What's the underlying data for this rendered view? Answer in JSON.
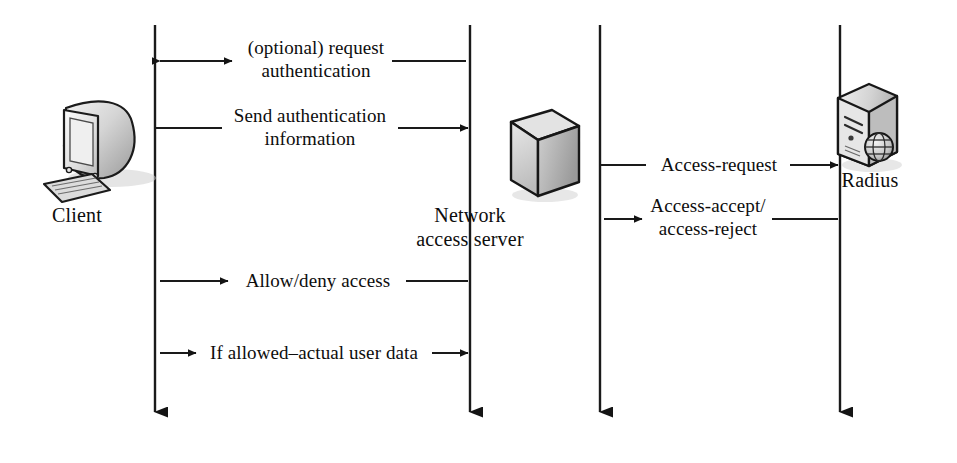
{
  "figure": {
    "type": "sequence-diagram",
    "background_color": "#ffffff",
    "line_color": "#1a1a1a",
    "text_color": "#0d0d0d"
  },
  "actors": [
    {
      "id": "client",
      "label": "Client",
      "icon": "desktop-computer-icon",
      "lifeline_x": 155
    },
    {
      "id": "nas",
      "label": "Network\naccess server",
      "icon": "network-box-icon",
      "lifeline_x": 470
    },
    {
      "id": "nas-right",
      "label": "",
      "icon": "",
      "lifeline_x": 600
    },
    {
      "id": "radius",
      "label": "Radius",
      "icon": "rack-server-globe-icon",
      "lifeline_x": 840
    }
  ],
  "messages": [
    {
      "id": "msg-request-authentication",
      "label": "(optional) request\nauthentication",
      "from": "nas",
      "to": "client",
      "direction": "left",
      "y": 61
    },
    {
      "id": "msg-send-authentication-information",
      "label": "Send authentication\ninformation",
      "from": "client",
      "to": "nas",
      "direction": "right",
      "y": 128
    },
    {
      "id": "msg-access-request",
      "label": "Access-request",
      "from": "nas-right",
      "to": "radius",
      "direction": "right",
      "y": 165
    },
    {
      "id": "msg-access-accept-reject",
      "label": "Access-accept/\naccess-reject",
      "from": "radius",
      "to": "nas-right",
      "direction": "left",
      "y": 219
    },
    {
      "id": "msg-allow-deny-access",
      "label": "Allow/deny access",
      "from": "nas",
      "to": "client",
      "direction": "left",
      "y": 281
    },
    {
      "id": "msg-if-allowed-actual-user-data",
      "label": "If allowed–actual user data",
      "from": "client",
      "to": "nas",
      "direction": "both",
      "y": 353
    }
  ]
}
